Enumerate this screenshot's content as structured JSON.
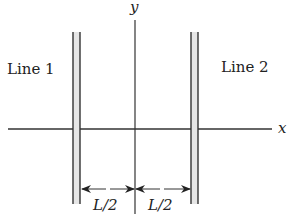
{
  "diagram": {
    "labels": {
      "line1": "Line 1",
      "line2": "Line 2",
      "axis_x": "x",
      "axis_y": "y",
      "dim_left": "L/2",
      "dim_right": "L/2"
    },
    "colors": {
      "stroke": "#222222",
      "background": "#ffffff"
    }
  }
}
